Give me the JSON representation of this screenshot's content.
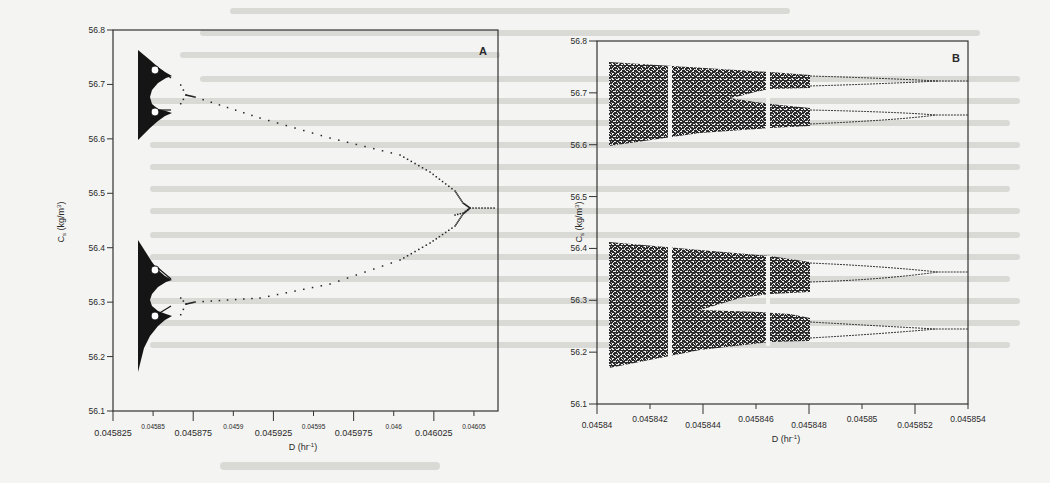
{
  "figure": {
    "panels": [
      "A",
      "B"
    ]
  },
  "chart_data": [
    {
      "panel_label": "A",
      "type": "scatter",
      "title": "",
      "xlabel": "D (hr⁻¹)",
      "ylabel": "Cₛ (kg/m³)",
      "xlim": [
        0.045825,
        0.046065
      ],
      "ylim": [
        56.1,
        56.8
      ],
      "grid": false,
      "legend": null,
      "x_ticks_major": [
        "0.045825",
        "0.045875",
        "0.045925",
        "0.045975",
        "0.046025"
      ],
      "x_ticks_minor": [
        "0.04585",
        "0.0459",
        "0.04595",
        "0.046",
        "0.04605"
      ],
      "y_ticks": [
        "56.8",
        "56.7",
        "56.6",
        "56.5",
        "56.4",
        "56.3",
        "56.2",
        "56.1"
      ],
      "description": "Bifurcation diagram: single branch at high D (~56.47) period-doubles near D≈0.04603 into two branches (~56.50 and ~56.45), which diverge toward lower D (upper pair ~56.67/56.72, lower pair ~56.26/56.31) and further period-double, entering chaos (dense black bands) near D≈0.04584.",
      "series": [
        {
          "name": "upper-upper",
          "x": [
            0.04606,
            0.046035,
            0.04601,
            0.045975,
            0.045925,
            0.045875,
            0.04586
          ],
          "y": [
            56.47,
            56.5,
            56.54,
            56.6,
            56.645,
            56.68,
            56.7
          ]
        },
        {
          "name": "lower-lower",
          "x": [
            0.04606,
            0.046035,
            0.04601,
            0.045975,
            0.045925,
            0.045875,
            0.04586
          ],
          "y": [
            56.47,
            56.44,
            56.4,
            56.36,
            56.33,
            56.31,
            56.28
          ]
        },
        {
          "name": "chaotic-band-upper",
          "x_range": [
            0.04584,
            0.04586
          ],
          "y_range": [
            56.6,
            56.76
          ]
        },
        {
          "name": "chaotic-band-lower",
          "x_range": [
            0.04584,
            0.04586
          ],
          "y_range": [
            56.175,
            56.42
          ]
        }
      ]
    },
    {
      "panel_label": "B",
      "type": "scatter",
      "title": "",
      "xlabel": "D (hr⁻¹)",
      "ylabel": "Cₛ (kg/m³)",
      "xlim": [
        0.04584,
        0.045854
      ],
      "ylim": [
        56.1,
        56.8
      ],
      "grid": false,
      "legend": null,
      "x_ticks": [
        "0.04584",
        "0.045842",
        "0.045844",
        "0.045846",
        "0.045848",
        "0.04585",
        "0.045852",
        "0.045854"
      ],
      "y_ticks": [
        "56.8",
        "56.7",
        "56.6",
        "56.5",
        "56.4",
        "56.3",
        "56.2",
        "56.1"
      ],
      "description": "Zoom of the chaotic region of panel A: four period-doubled branches at high D (~56.72, ~56.645, ~56.355, ~56.245) split and merge into wide chaotic bands toward low D, with periodic windows (white vertical gaps) near D≈0.045843 and D≈0.045846.",
      "series": [
        {
          "name": "branch-1",
          "x": [
            0.045854,
            0.045852,
            0.04585,
            0.045848
          ],
          "y": [
            56.72,
            56.72,
            56.73,
            56.735
          ]
        },
        {
          "name": "branch-2",
          "x": [
            0.045854,
            0.045852,
            0.04585,
            0.045848
          ],
          "y": [
            56.645,
            56.648,
            56.655,
            56.66
          ]
        },
        {
          "name": "branch-3",
          "x": [
            0.045854,
            0.045852,
            0.04585,
            0.045848
          ],
          "y": [
            56.355,
            56.358,
            56.37,
            56.375
          ]
        },
        {
          "name": "branch-4",
          "x": [
            0.045854,
            0.045852,
            0.04585,
            0.045848
          ],
          "y": [
            56.245,
            56.245,
            56.25,
            56.26
          ]
        },
        {
          "name": "chaotic-band-upper",
          "x_range": [
            0.0458405,
            0.045848
          ],
          "y_range_at_left": [
            56.6,
            56.76
          ],
          "y_range_at_right": [
            56.63,
            56.74
          ]
        },
        {
          "name": "chaotic-band-lower",
          "x_range": [
            0.0458405,
            0.045848
          ],
          "y_range_at_left": [
            56.175,
            56.42
          ],
          "y_range_at_right": [
            56.22,
            56.38
          ]
        }
      ],
      "periodic_windows_x": [
        0.0458428,
        0.0458465
      ]
    }
  ]
}
